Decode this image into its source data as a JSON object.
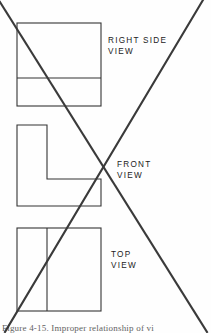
{
  "figure": {
    "caption": "Figure 4-15.  Improper relationship of vi",
    "background_color": "#fefefe",
    "line_color": "#333333",
    "cross_color": "#3a3a3a"
  },
  "labels": {
    "right_side_view": "RIGHT SIDE\nVIEW",
    "front_view": "FRONT\nVIEW",
    "top_view": "TOP\nVIEW"
  },
  "views": [
    {
      "name": "right-side-view",
      "shape": "rectangle-with-horizontal-divider",
      "x": 17,
      "y": 23,
      "width": 84,
      "height": 83,
      "divider_offset": 55
    },
    {
      "name": "front-view",
      "shape": "l-shape",
      "x": 17,
      "y": 125,
      "width": 84,
      "height": 81,
      "stem_width": 30,
      "foot_top_offset": 54
    },
    {
      "name": "top-view",
      "shape": "rectangle-with-vertical-divider",
      "x": 17,
      "y": 228,
      "width": 84,
      "height": 83,
      "divider_offset": 30
    }
  ],
  "cross_mark": {
    "name": "cancellation-cross",
    "stroke_width": 2.1,
    "line_a": {
      "x1": 0,
      "y1": 2,
      "x2": 207,
      "y2": 332
    },
    "line_b": {
      "x1": 203,
      "y1": 0,
      "x2": 5,
      "y2": 332
    }
  }
}
